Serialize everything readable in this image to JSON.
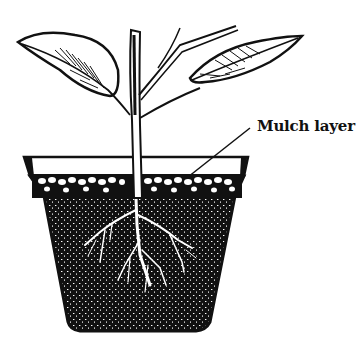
{
  "diagram": {
    "labels": [
      {
        "id": "mulch",
        "text": "Mulch layer",
        "points_to": "top layer of soil in pot"
      }
    ],
    "parts": [
      "leaves",
      "stem",
      "pot",
      "mulch-layer",
      "soil",
      "roots"
    ]
  },
  "colors": {
    "ink": "#111111",
    "paper": "#ffffff"
  }
}
